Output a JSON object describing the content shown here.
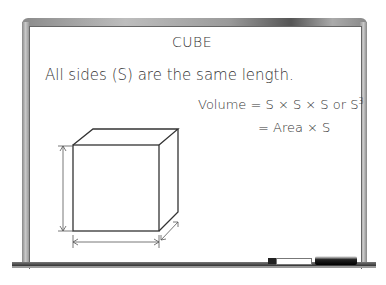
{
  "board": {
    "title": "CUBE",
    "statement": "All sides (S) are the same length.",
    "formula_volume_prefix": "Volume = S × S × S or S",
    "formula_exponent": "3",
    "formula_area": "= Area × S"
  },
  "figure": {
    "shape": "cube",
    "dimension_arrows": [
      "height",
      "width",
      "depth"
    ]
  },
  "tray_items": [
    "marker",
    "eraser"
  ]
}
